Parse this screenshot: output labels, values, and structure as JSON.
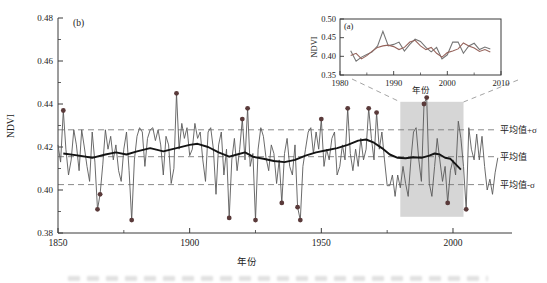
{
  "figure_title": "NDVI reconstruction figure",
  "colors": {
    "axis": "#3a3a3a",
    "text": "#222222",
    "annual_line": "#5a5a5a",
    "smooth_line": "#141414",
    "dashed_ref": "#7d7d7d",
    "marker": "#5a3a3a",
    "highlight": "#d6d6d6",
    "inset_line1": "#757575",
    "inset_line2": "#96645c",
    "connector": "#9a9a9a"
  },
  "chart_data": [
    {
      "type": "line",
      "panel_label": "(b)",
      "xlabel": "年份",
      "ylabel": "NDVI",
      "xlim": [
        1850,
        2022
      ],
      "ylim": [
        0.38,
        0.48
      ],
      "grid": false,
      "legend": "none",
      "xticks": [
        "1850",
        "1900",
        "1950",
        "2000"
      ],
      "xticks_minor": [
        1875,
        1925,
        1975
      ],
      "yticks": [
        "0.38",
        "0.40",
        "0.42",
        "0.44",
        "0.46",
        "0.48"
      ],
      "yticks_minor": [
        0.39,
        0.41,
        0.43,
        0.45,
        0.47
      ],
      "ref_lines": [
        {
          "label": "平均值+σ",
          "value": 0.428
        },
        {
          "label": "平均值",
          "value": 0.4155
        },
        {
          "label": "平均值-σ",
          "value": 0.4025
        }
      ],
      "highlight_region": {
        "start_year": 1980,
        "end_year": 2004,
        "top_value": 0.441,
        "bottom_value": 0.3875
      },
      "series": [
        {
          "name": "annual-ndvi",
          "x_start": 1850,
          "x_step": 1,
          "y": [
            0.421,
            0.413,
            0.437,
            0.419,
            0.407,
            0.414,
            0.428,
            0.421,
            0.409,
            0.428,
            0.42,
            0.411,
            0.404,
            0.427,
            0.413,
            0.391,
            0.398,
            0.412,
            0.428,
            0.419,
            0.425,
            0.414,
            0.421,
            0.409,
            0.404,
            0.419,
            0.427,
            0.409,
            0.386,
            0.414,
            0.425,
            0.429,
            0.427,
            0.411,
            0.424,
            0.428,
            0.429,
            0.423,
            0.428,
            0.421,
            0.407,
            0.425,
            0.421,
            0.403,
            0.41,
            0.445,
            0.419,
            0.431,
            0.424,
            0.429,
            0.416,
            0.419,
            0.431,
            0.424,
            0.427,
            0.414,
            0.404,
            0.427,
            0.429,
            0.419,
            0.398,
            0.421,
            0.427,
            0.407,
            0.419,
            0.387,
            0.414,
            0.424,
            0.409,
            0.419,
            0.433,
            0.414,
            0.438,
            0.411,
            0.417,
            0.386,
            0.419,
            0.429,
            0.425,
            0.415,
            0.409,
            0.421,
            0.417,
            0.403,
            0.414,
            0.394,
            0.417,
            0.424,
            0.411,
            0.407,
            0.421,
            0.392,
            0.386,
            0.411,
            0.419,
            0.427,
            0.429,
            0.417,
            0.427,
            0.419,
            0.433,
            0.411,
            0.419,
            0.414,
            0.424,
            0.427,
            0.407,
            0.411,
            0.421,
            0.414,
            0.438,
            0.417,
            0.409,
            0.419,
            0.411,
            0.424,
            0.414,
            0.419,
            0.438,
            0.424,
            0.414,
            0.436,
            0.419,
            0.427,
            0.414,
            0.402,
            0.402,
            0.407,
            0.397,
            0.407,
            0.401,
            0.411,
            0.403,
            0.397,
            0.414,
            0.427,
            0.429,
            0.414,
            0.404,
            0.44,
            0.443,
            0.403,
            0.397,
            0.411,
            0.424,
            0.414,
            0.404,
            0.411,
            0.394,
            0.409,
            0.414,
            0.407,
            0.432,
            0.424,
            0.411,
            0.391,
            0.429,
            0.419,
            0.414,
            0.426,
            0.414,
            0.425,
            0.411,
            0.4,
            0.405,
            0.398,
            0.408,
            0.415
          ]
        },
        {
          "name": "smoothed-ndvi",
          "x": [
            1852,
            1858,
            1863,
            1868,
            1872,
            1876,
            1880,
            1885,
            1890,
            1895,
            1900,
            1903,
            1907,
            1911,
            1915,
            1918,
            1921,
            1924,
            1928,
            1932,
            1936,
            1940,
            1944,
            1948,
            1952,
            1956,
            1960,
            1964,
            1967,
            1970,
            1973,
            1976,
            1979,
            1982,
            1985,
            1988,
            1991,
            1993,
            1995,
            1997,
            1999,
            2001,
            2003
          ],
          "y": [
            0.417,
            0.416,
            0.415,
            0.4165,
            0.4175,
            0.4165,
            0.418,
            0.4195,
            0.418,
            0.4195,
            0.421,
            0.4215,
            0.42,
            0.4175,
            0.4155,
            0.4165,
            0.4175,
            0.4155,
            0.4145,
            0.4135,
            0.413,
            0.414,
            0.416,
            0.4175,
            0.4185,
            0.4195,
            0.421,
            0.423,
            0.4235,
            0.422,
            0.4195,
            0.4165,
            0.415,
            0.4148,
            0.4152,
            0.415,
            0.416,
            0.417,
            0.4165,
            0.415,
            0.4145,
            0.412,
            0.4095
          ]
        }
      ],
      "extreme_markers": {
        "x": [
          1852,
          1865,
          1866,
          1878,
          1895,
          1915,
          1920,
          1922,
          1925,
          1935,
          1941,
          1942,
          1950,
          1960,
          1968,
          1971,
          1989,
          1990,
          1998,
          2005
        ],
        "y": [
          0.437,
          0.391,
          0.398,
          0.386,
          0.445,
          0.387,
          0.433,
          0.438,
          0.386,
          0.394,
          0.392,
          0.386,
          0.433,
          0.438,
          0.438,
          0.436,
          0.44,
          0.443,
          0.394,
          0.391
        ]
      }
    },
    {
      "type": "line",
      "panel_label": "(a)",
      "xlabel": "年份",
      "ylabel": "NDVI",
      "xlim": [
        1980,
        2010
      ],
      "ylim": [
        0.35,
        0.5
      ],
      "grid": false,
      "legend": "none",
      "xticks": [
        "1980",
        "1990",
        "2000",
        "2010"
      ],
      "xticks_minor": [
        1985,
        1995,
        2005
      ],
      "yticks": [
        "0.35",
        "0.40",
        "0.45",
        "0.50"
      ],
      "series": [
        {
          "name": "satellite-ndvi",
          "x_start": 1982,
          "x_step": 1,
          "y": [
            0.415,
            0.387,
            0.398,
            0.405,
            0.412,
            0.428,
            0.467,
            0.428,
            0.432,
            0.438,
            0.414,
            0.432,
            0.446,
            0.44,
            0.424,
            0.412,
            0.424,
            0.393,
            0.404,
            0.438,
            0.438,
            0.408,
            0.428,
            0.435,
            0.418,
            0.425,
            0.42
          ]
        },
        {
          "name": "reconstructed-ndvi",
          "x_start": 1982,
          "x_step": 1,
          "y": [
            0.402,
            0.408,
            0.393,
            0.402,
            0.414,
            0.424,
            0.428,
            0.43,
            0.426,
            0.418,
            0.424,
            0.438,
            0.443,
            0.428,
            0.418,
            0.424,
            0.408,
            0.398,
            0.41,
            0.414,
            0.42,
            0.436,
            0.428,
            0.422,
            0.413,
            0.418,
            0.412
          ]
        }
      ]
    }
  ]
}
